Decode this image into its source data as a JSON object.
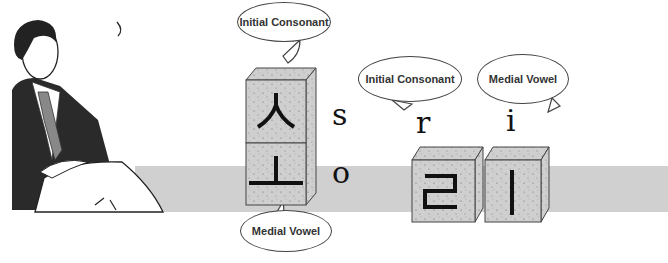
{
  "labels": {
    "bubble_1": "Initial Consonant",
    "bubble_2": "Medial Vowel",
    "bubble_3": "Initial Consonant",
    "bubble_4": "Medial Vowel"
  },
  "blocks": [
    {
      "hangul": "ㅅ",
      "latin": "s",
      "role": "Initial Consonant"
    },
    {
      "hangul": "ㅗ",
      "latin": "o",
      "role": "Medial Vowel"
    },
    {
      "hangul": "ㄹ",
      "latin": "r",
      "role": "Initial Consonant"
    },
    {
      "hangul": "ㅣ",
      "latin": "i",
      "role": "Medial Vowel"
    }
  ],
  "latin": {
    "s": "s",
    "o": "o",
    "r": "r",
    "i": "i"
  },
  "colors": {
    "band": "#d0d0d0",
    "block_face": "#cfcfcf",
    "ink": "#111111"
  }
}
